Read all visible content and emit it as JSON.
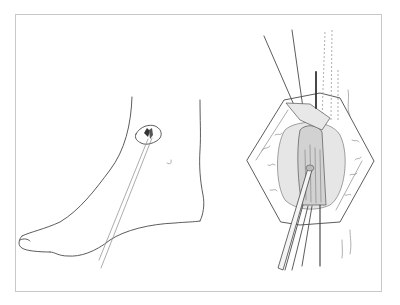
{
  "figure": {
    "panels": [
      {
        "id": "left",
        "subject": "foot-lateral-view-with-incision"
      },
      {
        "id": "right",
        "subject": "surgical-exposure-with-retracted-tendon"
      }
    ],
    "colors": {
      "line": "#4a4a4a",
      "frame": "#c8c8c8",
      "background": "#ffffff"
    }
  }
}
